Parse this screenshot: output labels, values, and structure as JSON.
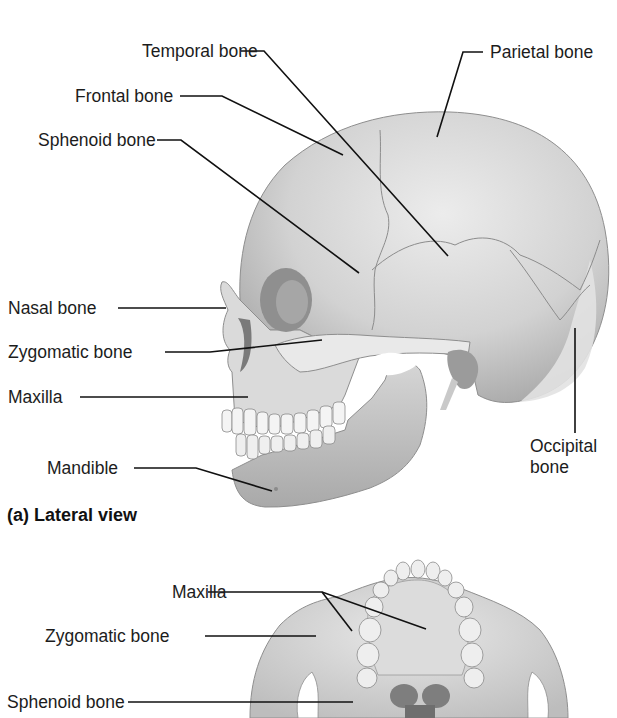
{
  "figure": {
    "caption_a": "(a) Lateral view",
    "colors": {
      "background": "#ffffff",
      "bone_light": "#e6e6e6",
      "bone_mid": "#c9c9c9",
      "bone_dark": "#9a9a9a",
      "leader_line": "#111111",
      "text": "#1c1c1c"
    }
  },
  "lateral_view": {
    "labels": [
      {
        "id": "temporal",
        "text": "Temporal bone"
      },
      {
        "id": "parietal",
        "text": "Parietal bone"
      },
      {
        "id": "frontal",
        "text": "Frontal bone"
      },
      {
        "id": "sphenoid",
        "text": "Sphenoid bone"
      },
      {
        "id": "nasal",
        "text": "Nasal bone"
      },
      {
        "id": "zygomatic",
        "text": "Zygomatic bone"
      },
      {
        "id": "maxilla",
        "text": "Maxilla"
      },
      {
        "id": "occipital",
        "text": "Occipital bone"
      },
      {
        "id": "mandible",
        "text": "Mandible"
      }
    ]
  },
  "inferior_view": {
    "labels": [
      {
        "id": "maxilla",
        "text": "Maxilla"
      },
      {
        "id": "zygomatic",
        "text": "Zygomatic bone"
      },
      {
        "id": "sphenoid",
        "text": "Sphenoid bone"
      }
    ]
  }
}
